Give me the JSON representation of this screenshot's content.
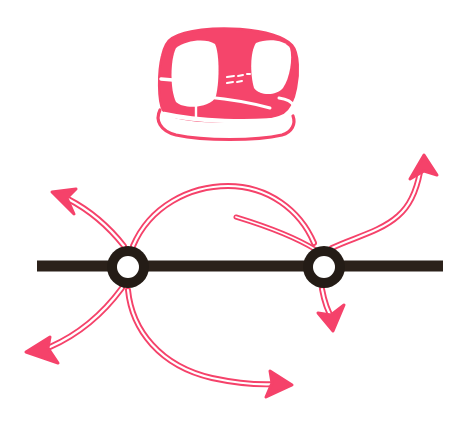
{
  "illustration": {
    "title": "Transit pod over a track with two junction nodes and routing arrows",
    "caption": "Stylized red transit pod above a horizontal rail with two ring junctions and six outlined directional route arrows",
    "background_color": "#ffffff",
    "accent_color": "#f5426a",
    "accent_light_color": "#fa7f99",
    "rail_color": "#2b211a"
  },
  "vehicle": {
    "name": "transit-pod",
    "label": "Transit pod",
    "body_color": "#f5456b",
    "bounds": {
      "x": 158,
      "y": 28,
      "width": 140,
      "height": 114
    },
    "parts": [
      {
        "name": "pod-body",
        "label": "Pod body shell"
      },
      {
        "name": "pod-side-window",
        "label": "Large side window"
      },
      {
        "name": "pod-windshield",
        "label": "Front windshield"
      },
      {
        "name": "pod-quarter-window",
        "label": "Rear quarter window"
      },
      {
        "name": "pod-door-seam",
        "label": "Door seam"
      },
      {
        "name": "pod-skirt",
        "label": "Lower skirt stripe"
      },
      {
        "name": "pod-shadow-line",
        "label": "Ground shadow line"
      }
    ]
  },
  "rail": {
    "name": "horizontal-rail",
    "label": "Horizontal rail line",
    "color": "#2b211a",
    "x_start": 37,
    "x_end": 443,
    "y_center": 266,
    "thickness": 11
  },
  "nodes": [
    {
      "id": "left-node",
      "label": "Left junction node",
      "cx": 128,
      "cy": 267,
      "outer_radius": 21,
      "inner_radius": 11,
      "color": "#241c16"
    },
    {
      "id": "right-node",
      "label": "Right junction node",
      "cx": 324,
      "cy": 267,
      "outer_radius": 21,
      "inner_radius": 11,
      "color": "#241c16"
    }
  ],
  "arrows": [
    {
      "id": "arrow-upper-left",
      "label": "Route exiting up-left from left node",
      "from_node": "left-node",
      "direction": "up-left",
      "tip": {
        "x": 52,
        "y": 192
      }
    },
    {
      "id": "arrow-lower-left",
      "label": "Route exiting left from left node",
      "from_node": "left-node",
      "direction": "left",
      "tip": {
        "x": 26,
        "y": 352
      }
    },
    {
      "id": "arrow-arc-left-to-right",
      "label": "Upper arc route from left node to right node",
      "from_node": "left-node",
      "to_node": "right-node",
      "direction": "arc-over",
      "tip": {
        "x": 312,
        "y": 248
      }
    },
    {
      "id": "arrow-lower-sweep-right",
      "label": "Lower sweeping route to the right",
      "from_node": "left-node",
      "direction": "down-right",
      "tip": {
        "x": 292,
        "y": 385
      }
    },
    {
      "id": "arrow-upper-right",
      "label": "Route exiting up-right from right node",
      "from_node": "right-node",
      "direction": "up-right",
      "tip": {
        "x": 424,
        "y": 155
      }
    },
    {
      "id": "arrow-down-right-node",
      "label": "Route exiting downward from right node",
      "from_node": "right-node",
      "direction": "down",
      "tip": {
        "x": 333,
        "y": 331
      }
    }
  ]
}
